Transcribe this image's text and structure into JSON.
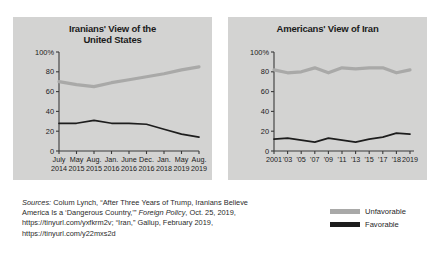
{
  "colors": {
    "panel_background": "#d3d3d2",
    "page_background": "#ffffff",
    "unfavorable_line": "#a9a9a8",
    "favorable_line": "#1d1d1d",
    "axis": "#3a3a3a",
    "text": "#1b1b1b"
  },
  "charts": [
    {
      "id": "iranians-view-of-us",
      "title_line1": "Iranians' View of the",
      "title_line2": "United States"
    },
    {
      "id": "americans-view-of-iran",
      "title_line1": "Americans' View of Iran",
      "title_line2": ""
    }
  ],
  "legend": {
    "items": [
      {
        "label": "Unfavorable",
        "color": "#a9a9a8"
      },
      {
        "label": "Favorable",
        "color": "#1d1d1d"
      }
    ]
  },
  "sources": {
    "line1": "Sources: Colum Lynch, “After Three Years of Trump, Iranians Believe",
    "line1_lead": "Sources:",
    "line2": "America Is a ‘Dangerous Country,’” Foreign Policy, Oct. 25, 2019,",
    "line2_a": "America Is a ‘Dangerous Country,’” ",
    "line2_ital": "Foreign Policy",
    "line2_b": ", Oct. 25, 2019,",
    "line3": "https://tinyurl.com/yxfkrm2v; “Iran,” Gallup, February 2019,",
    "line4": "https://tinyurl.com/y22mxs2d"
  },
  "chart_data": [
    {
      "type": "line",
      "title": "Iranians' View of the United States",
      "xlabel": "",
      "ylabel": "",
      "ylim": [
        0,
        100
      ],
      "ytick_labels": [
        "100%",
        "80",
        "60",
        "40",
        "20",
        "0"
      ],
      "yticks": [
        100,
        80,
        60,
        40,
        20,
        0
      ],
      "grid": false,
      "legend_position": "external-bottom-right",
      "categories": [
        "July 2014",
        "May 2015",
        "Aug. 2015",
        "Jan. 2016",
        "June 2016",
        "Dec. 2016",
        "Jan. 2018",
        "May 2019",
        "Aug. 2019"
      ],
      "tick_labels_top": [
        "July",
        "May",
        "Aug.",
        "Jan.",
        "June",
        "Dec.",
        "Jan.",
        "May",
        "Aug."
      ],
      "tick_labels_bottom": [
        "2014",
        "2015",
        "2015",
        "2016",
        "2016",
        "2016",
        "2018",
        "2019",
        "2019"
      ],
      "series": [
        {
          "name": "Unfavorable",
          "color": "#a9a9a8",
          "values": [
            70,
            67,
            65,
            69,
            72,
            75,
            78,
            82,
            85
          ]
        },
        {
          "name": "Favorable",
          "color": "#1d1d1d",
          "values": [
            28,
            28,
            31,
            28,
            28,
            27,
            22,
            17,
            14
          ]
        }
      ]
    },
    {
      "type": "line",
      "title": "Americans' View of Iran",
      "xlabel": "",
      "ylabel": "",
      "ylim": [
        0,
        100
      ],
      "ytick_labels": [
        "100%",
        "80",
        "60",
        "40",
        "20",
        "0"
      ],
      "yticks": [
        100,
        80,
        60,
        40,
        20,
        0
      ],
      "grid": false,
      "legend_position": "external-bottom-right",
      "categories": [
        "2001",
        "'03",
        "'05",
        "'07",
        "'09",
        "'11",
        "'13",
        "'15",
        "'17",
        "'18",
        "2019"
      ],
      "tick_labels_top": [
        "2001",
        "'03",
        "'05",
        "'07",
        "'09",
        "'11",
        "'13",
        "'15",
        "'17",
        "'18",
        "2019"
      ],
      "series": [
        {
          "name": "Unfavorable",
          "color": "#a9a9a8",
          "values": [
            82,
            79,
            80,
            84,
            79,
            84,
            83,
            84,
            84,
            79,
            82
          ]
        },
        {
          "name": "Favorable",
          "color": "#1d1d1d",
          "values": [
            12,
            13,
            11,
            9,
            13,
            11,
            9,
            12,
            14,
            18,
            17
          ]
        }
      ]
    }
  ]
}
